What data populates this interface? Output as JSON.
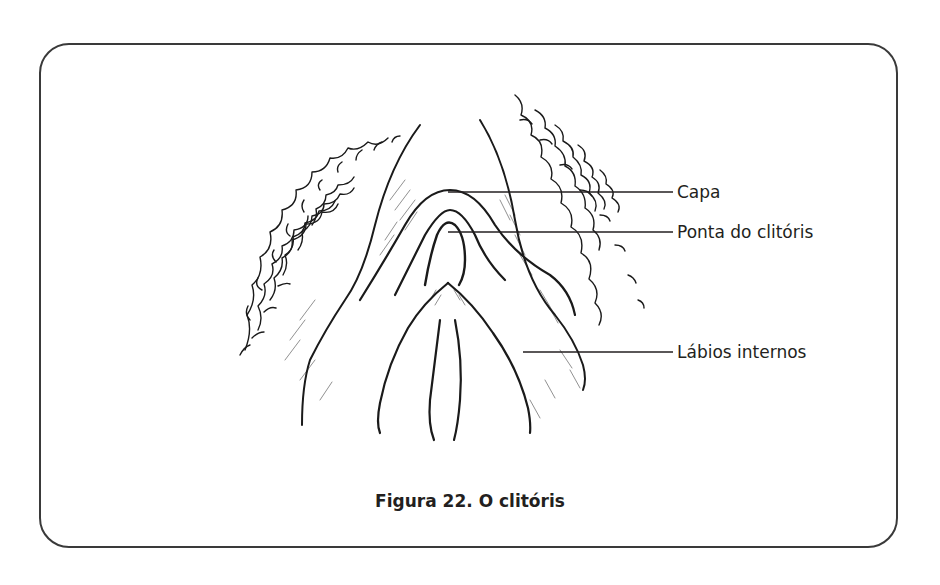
{
  "figure": {
    "caption": "Figura 22. O clitóris",
    "labels": [
      {
        "text": "Capa",
        "line_y": 192,
        "line_x1": 448,
        "line_x2": 673
      },
      {
        "text": "Ponta do clitóris",
        "line_y": 232,
        "line_x1": 448,
        "line_x2": 673
      },
      {
        "text": "Lábios internos",
        "line_y": 352,
        "line_x1": 523,
        "line_x2": 673
      }
    ]
  },
  "colors": {
    "ink": "#231f20",
    "frame": "#3a3a3a",
    "background": "#ffffff"
  }
}
